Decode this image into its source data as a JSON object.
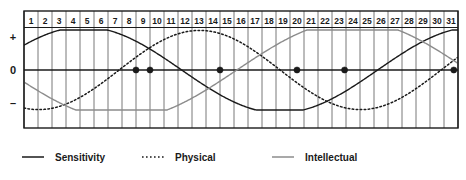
{
  "chart_data": {
    "type": "line",
    "title": "",
    "xlabel": "",
    "ylabel": "",
    "grid": true,
    "legend_position": "bottom",
    "xlim": [
      1,
      32
    ],
    "ylim": [
      -1,
      1
    ],
    "x_tick_labels": [
      "1",
      "2",
      "3",
      "4",
      "5",
      "6",
      "7",
      "8",
      "9",
      "10",
      "11",
      "12",
      "13",
      "14",
      "15",
      "16",
      "17",
      "18",
      "19",
      "20",
      "21",
      "22",
      "23",
      "24",
      "25",
      "26",
      "27",
      "28",
      "29",
      "30",
      "31"
    ],
    "y_tick_labels": [
      "+",
      "0",
      "–"
    ],
    "series": [
      {
        "name": "Sensitivity",
        "style": "solid",
        "color": "#1a1a1a",
        "period_days": 28,
        "phase_start_value": 0.62,
        "zero_crossings": [
          10.0,
          23.9
        ],
        "peaks": [
          3.5,
          31.5
        ],
        "troughs": [
          17.0
        ],
        "values": [
          0.62,
          0.8,
          0.93,
          0.99,
          0.99,
          0.92,
          0.79,
          0.61,
          0.38,
          0.13,
          -0.13,
          -0.38,
          -0.61,
          -0.79,
          -0.92,
          -0.99,
          -0.99,
          -0.93,
          -0.8,
          -0.62,
          -0.38,
          -0.13,
          0.13,
          0.38,
          0.62,
          0.8,
          0.93,
          0.99,
          0.99,
          0.92,
          0.79
        ]
      },
      {
        "name": "Physical",
        "style": "dotted",
        "color": "#1a1a1a",
        "period_days": 23,
        "phase_start_value": -0.95,
        "zero_crossings": [
          9.0,
          20.5
        ],
        "peaks": [
          14.8
        ],
        "troughs": [
          3.2
        ],
        "values": [
          -0.95,
          -0.99,
          -1.0,
          -0.97,
          -0.9,
          -0.79,
          -0.64,
          -0.46,
          -0.25,
          -0.03,
          0.2,
          0.42,
          0.61,
          0.77,
          0.9,
          0.98,
          1.0,
          0.97,
          0.88,
          0.74,
          0.56,
          0.35,
          0.12,
          -0.12,
          -0.35,
          -0.56,
          -0.74,
          -0.88,
          -0.97,
          -1.0,
          -0.98
        ]
      },
      {
        "name": "Intellectual",
        "style": "solid",
        "color": "#8c8c8c",
        "period_days": 33,
        "phase_start_value": -0.3,
        "zero_crossings": [
          15.0,
          31.6
        ],
        "peaks": [
          26.0
        ],
        "troughs": [
          4.0
        ],
        "values": [
          -0.3,
          -0.52,
          -0.71,
          -0.86,
          -0.95,
          -0.99,
          -0.98,
          -0.91,
          -0.79,
          -0.63,
          -0.44,
          -0.23,
          -0.01,
          0.21,
          0.42,
          0.61,
          0.77,
          0.89,
          0.96,
          1.0,
          0.98,
          0.92,
          0.81,
          0.67,
          0.49,
          0.29,
          0.08,
          -0.14,
          -0.35,
          -0.55,
          -0.72
        ]
      }
    ],
    "zero_crossing_markers": [
      {
        "day": 9.0,
        "series": "Physical",
        "direction": "ascending"
      },
      {
        "day": 10.0,
        "series": "Sensitivity",
        "direction": "descending"
      },
      {
        "day": 15.0,
        "series": "Intellectual",
        "direction": "ascending"
      },
      {
        "day": 20.5,
        "series": "Physical",
        "direction": "descending"
      },
      {
        "day": 23.9,
        "series": "Sensitivity",
        "direction": "ascending"
      },
      {
        "day": 31.7,
        "series": "Intellectual",
        "direction": "descending"
      }
    ]
  },
  "axis": {
    "positive_label": "+",
    "zero_label": "0",
    "negative_label": "–"
  },
  "days": [
    "1",
    "2",
    "3",
    "4",
    "5",
    "6",
    "7",
    "8",
    "9",
    "10",
    "11",
    "12",
    "13",
    "14",
    "15",
    "16",
    "17",
    "18",
    "19",
    "20",
    "21",
    "22",
    "23",
    "24",
    "25",
    "26",
    "27",
    "28",
    "29",
    "30",
    "31"
  ],
  "legend": {
    "items": [
      {
        "label": "Sensitivity",
        "swatch": "solid-dark-line-icon",
        "color": "#1a1a1a",
        "style": "solid"
      },
      {
        "label": "Physical",
        "swatch": "dotted-dark-line-icon",
        "color": "#1a1a1a",
        "style": "dotted"
      },
      {
        "label": "Intellectual",
        "swatch": "solid-gray-line-icon",
        "color": "#8c8c8c",
        "style": "solid"
      }
    ]
  },
  "colors": {
    "sensitivity": "#1a1a1a",
    "physical": "#1a1a1a",
    "intellectual": "#8c8c8c",
    "grid": "#6a6a6a",
    "frame": "#1a1a1a",
    "background": "#ffffff"
  }
}
